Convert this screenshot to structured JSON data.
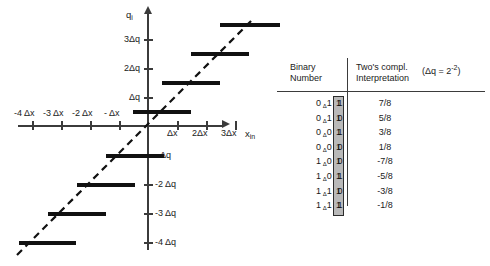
{
  "figure": {
    "y_axis_name": "q",
    "y_axis_name_sub": "i",
    "x_axis_name": "x",
    "x_axis_name_sub": "in",
    "x_ticks_negative": [
      "-4 Δx",
      "-3 Δx",
      "-2 Δx",
      "- Δx"
    ],
    "x_ticks_positive": [
      "Δx",
      "2Δx",
      "3Δx"
    ],
    "y_ticks_positive": [
      "Δq",
      "2Δq",
      "3Δq"
    ],
    "y_ticks_negative": [
      "- Δq",
      "-2 Δq",
      "-3 Δq",
      "-4 Δq"
    ]
  },
  "table": {
    "header": {
      "col1_line1": "Binary",
      "col1_line2": "Number",
      "col2_line1": "Two's compl.",
      "col2_line2": "Interpretation",
      "note_prefix": "(Δq = 2",
      "note_exponent": "-2",
      "note_suffix": ")"
    },
    "rows": [
      {
        "msb": "0",
        "mid": "1 1",
        "lsb": "1",
        "value": "7/8"
      },
      {
        "msb": "0",
        "mid": "1 0",
        "lsb": "1",
        "value": "5/8"
      },
      {
        "msb": "0",
        "mid": "0 1",
        "lsb": "1",
        "value": "3/8"
      },
      {
        "msb": "0",
        "mid": "0 0",
        "lsb": "1",
        "value": "1/8"
      },
      {
        "msb": "1",
        "mid": "0 0",
        "lsb": "1",
        "value": "-7/8"
      },
      {
        "msb": "1",
        "mid": "0 1",
        "lsb": "1",
        "value": "-5/8"
      },
      {
        "msb": "1",
        "mid": "1 0",
        "lsb": "1",
        "value": "-3/8"
      },
      {
        "msb": "1",
        "mid": "1 1",
        "lsb": "1",
        "value": "-1/8"
      }
    ],
    "radix_marker": "Δ"
  },
  "chart_data": {
    "type": "line",
    "title": "",
    "xlabel": "x_in",
    "ylabel": "q_i",
    "xlim": [
      -4.5,
      3.9
    ],
    "ylim": [
      -4.6,
      4.2
    ],
    "grid": false,
    "legend": null,
    "series": [
      {
        "name": "ideal (dashed reference line)",
        "style": "dashed",
        "x": [
          -4.5,
          3.6
        ],
        "y": [
          -4.6,
          3.9
        ]
      },
      {
        "name": "quantizer staircase",
        "style": "steps",
        "step_segments": [
          {
            "x_start": -4.5,
            "x_end": -3.5,
            "y": -3.5
          },
          {
            "x_start": -3.5,
            "x_end": -2.5,
            "y": -2.5
          },
          {
            "x_start": -2.5,
            "x_end": -1.5,
            "y": -1.5
          },
          {
            "x_start": -1.5,
            "x_end": -0.5,
            "y": -0.5
          },
          {
            "x_start": -0.5,
            "x_end": 0.5,
            "y": 0.5
          },
          {
            "x_start": 0.5,
            "x_end": 1.5,
            "y": 1.5
          },
          {
            "x_start": 1.5,
            "x_end": 2.5,
            "y": 2.5
          },
          {
            "x_start": 2.5,
            "x_end": 3.6,
            "y": 3.5
          }
        ]
      }
    ],
    "xticks": [
      -4,
      -3,
      -2,
      -1,
      1,
      2,
      3
    ],
    "xticklabels": [
      "-4 Δx",
      "-3 Δx",
      "-2 Δx",
      "- Δx",
      "Δx",
      "2Δx",
      "3Δx"
    ],
    "yticks": [
      -4,
      -3,
      -2,
      -1,
      1,
      2,
      3
    ],
    "yticklabels": [
      "-4 Δq",
      "-3 Δq",
      "-2 Δq",
      "- Δq",
      "Δq",
      "2Δq",
      "3Δq"
    ]
  }
}
